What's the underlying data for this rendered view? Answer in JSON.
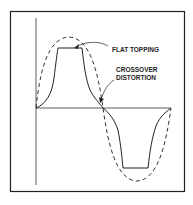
{
  "diagram": {
    "type": "waveform-distortion",
    "labels": {
      "flat_topping": "FLAT TOPPING",
      "crossover_line1": "CROSSOVER",
      "crossover_line2": "DISTORTION"
    },
    "curves": [
      {
        "name": "ideal-sine",
        "style": "dashed"
      },
      {
        "name": "distorted-output",
        "style": "solid",
        "features": [
          "flat topping",
          "crossover distortion"
        ]
      }
    ],
    "colors": {
      "stroke": "#222222",
      "background": "#ffffff"
    }
  }
}
